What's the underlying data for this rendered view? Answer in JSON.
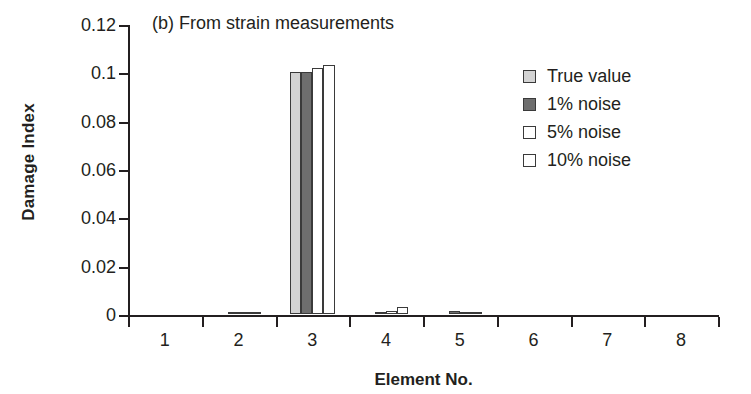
{
  "chart_data": {
    "type": "bar",
    "title": "(b) From strain measurements",
    "xlabel": "Element No.",
    "ylabel": "Damage Index",
    "categories": [
      "1",
      "2",
      "3",
      "4",
      "5",
      "6",
      "7",
      "8"
    ],
    "ylim": [
      0,
      0.12
    ],
    "yticks": [
      "0",
      "0.02",
      "0.04",
      "0.06",
      "0.08",
      "0.1",
      "0.12"
    ],
    "ytick_values": [
      0,
      0.02,
      0.04,
      0.06,
      0.08,
      0.1,
      0.12
    ],
    "grid": false,
    "legend_position": "right",
    "series": [
      {
        "name": "True value",
        "color": "#d3d3d3",
        "edge": "#3a3a3a",
        "values": [
          0,
          0,
          0.1,
          0,
          0,
          0,
          0,
          0
        ]
      },
      {
        "name": "1% noise",
        "color": "#6e6e6e",
        "edge": "#3a3a3a",
        "values": [
          0,
          0.0006,
          0.1003,
          0.0009,
          0.0011,
          0,
          0,
          0
        ]
      },
      {
        "name": "5% noise",
        "color": "#ffffff",
        "edge": "#3a3a3a",
        "values": [
          0,
          0.0004,
          0.1018,
          0.0012,
          0.0009,
          0,
          0,
          0
        ]
      },
      {
        "name": "10% noise",
        "color": "#ffffff",
        "edge": "#3a3a3a",
        "values": [
          0,
          0.0003,
          0.1029,
          0.0028,
          0.0006,
          0,
          0,
          0
        ]
      }
    ]
  }
}
